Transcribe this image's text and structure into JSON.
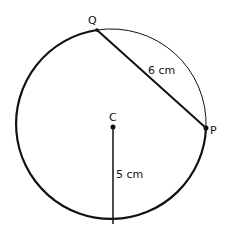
{
  "diagram": {
    "type": "circle-geometry",
    "points": {
      "Q": {
        "label": "Q"
      },
      "P": {
        "label": "P"
      },
      "C": {
        "label": "C"
      }
    },
    "chord_QP_label": "6 cm",
    "radius_label": "5 cm",
    "colors": {
      "stroke": "#111111",
      "background": "#ffffff"
    }
  }
}
